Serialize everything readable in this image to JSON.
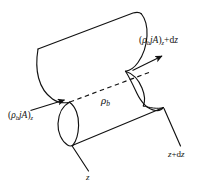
{
  "figure": {
    "background_color": "#ffffff",
    "line_color": "#111111",
    "labels": {
      "flux_left": {
        "name": "mass-flux-in",
        "open_paren": "(",
        "rho": "ρ",
        "rho_sub": "b",
        "flux": "jA",
        "close_paren": ")",
        "position_sub": "z",
        "full_text": "(ρb jA)z"
      },
      "flux_right": {
        "name": "mass-flux-out",
        "open_paren": "(",
        "rho": "ρ",
        "rho_sub": "b",
        "flux": "jA",
        "close_paren": ")",
        "position_sub": "z",
        "increment": "+d",
        "increment_var": "z",
        "full_text": "(ρb jA)z+dz"
      },
      "bulk_density": {
        "name": "bulk-density",
        "rho": "ρ",
        "rho_sub": "b",
        "full_text": "ρb"
      },
      "axis_z": {
        "name": "axial-position-z",
        "text": "z"
      },
      "axis_z_dz": {
        "name": "axial-position-z-plus-dz",
        "var": "z",
        "plus": "+",
        "differential": "d",
        "differential_var": "z",
        "full_text": "z+dz"
      }
    }
  }
}
